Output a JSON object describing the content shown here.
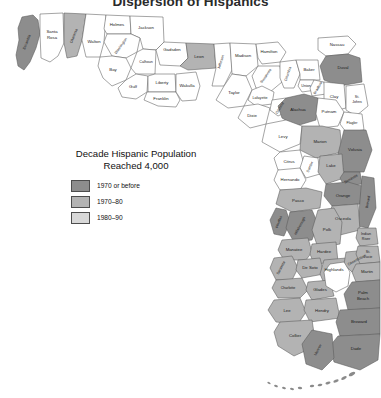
{
  "title": "Dispersion of Hispanics",
  "legend": {
    "title_line1": "Decade Hispanic Population",
    "title_line2": "Reached 4,000",
    "items": [
      {
        "label": "1970 or before",
        "color": "#8d8d8d",
        "level": 1
      },
      {
        "label": "1970–80",
        "color": "#b3b3b3",
        "level": 2
      },
      {
        "label": "1980–90",
        "color": "#d8d8d8",
        "level": 3
      }
    ]
  },
  "map": {
    "state": "Florida",
    "unshaded_color": "#ffffff",
    "border_color": "#5a5a5a",
    "water_feature": "Lake Okeechobee",
    "island_chain": "Florida Keys",
    "counties": [
      {
        "name": "Escambia",
        "level": 1,
        "rot": -68
      },
      {
        "name": "Santa Rosa",
        "level": 0,
        "rot": 0,
        "two_line": true
      },
      {
        "name": "Okaloosa",
        "level": 2,
        "rot": -68
      },
      {
        "name": "Walton",
        "level": 0,
        "rot": 0
      },
      {
        "name": "Holmes",
        "level": 0,
        "rot": 0
      },
      {
        "name": "Jackson",
        "level": 0,
        "rot": 0
      },
      {
        "name": "Washington",
        "level": 0,
        "rot": -55
      },
      {
        "name": "Bay",
        "level": 0,
        "rot": 0
      },
      {
        "name": "Calhoun",
        "level": 0,
        "rot": 0
      },
      {
        "name": "Gulf",
        "level": 0,
        "rot": 0
      },
      {
        "name": "Liberty",
        "level": 0,
        "rot": 0
      },
      {
        "name": "Franklin",
        "level": 0,
        "rot": 0
      },
      {
        "name": "Gadsden",
        "level": 0,
        "rot": 0
      },
      {
        "name": "Leon",
        "level": 2,
        "rot": 0
      },
      {
        "name": "Wakulla",
        "level": 0,
        "rot": 0
      },
      {
        "name": "Jefferson",
        "level": 0,
        "rot": -72
      },
      {
        "name": "Madison",
        "level": 0,
        "rot": 0
      },
      {
        "name": "Taylor",
        "level": 0,
        "rot": 0
      },
      {
        "name": "Hamilton",
        "level": 0,
        "rot": 0
      },
      {
        "name": "Suwannee",
        "level": 0,
        "rot": -55
      },
      {
        "name": "Columbia",
        "level": 0,
        "rot": -72
      },
      {
        "name": "Lafayette",
        "level": 0,
        "rot": 0
      },
      {
        "name": "Dixie",
        "level": 0,
        "rot": 0
      },
      {
        "name": "Gilchrist",
        "level": 0,
        "rot": -60
      },
      {
        "name": "Baker",
        "level": 0,
        "rot": 0
      },
      {
        "name": "Nassau",
        "level": 0,
        "rot": 0
      },
      {
        "name": "Duval",
        "level": 1,
        "rot": 0
      },
      {
        "name": "Union",
        "level": 0,
        "rot": 0
      },
      {
        "name": "Bradford",
        "level": 0,
        "rot": -60
      },
      {
        "name": "Clay",
        "level": 0,
        "rot": 0
      },
      {
        "name": "St. Johns",
        "level": 0,
        "rot": 0,
        "two_line": true
      },
      {
        "name": "Alachua",
        "level": 1,
        "rot": 0
      },
      {
        "name": "Putnam",
        "level": 0,
        "rot": 0
      },
      {
        "name": "Flagler",
        "level": 0,
        "rot": 0
      },
      {
        "name": "Levy",
        "level": 0,
        "rot": 0
      },
      {
        "name": "Marion",
        "level": 2,
        "rot": 0
      },
      {
        "name": "Volusia",
        "level": 1,
        "rot": 0
      },
      {
        "name": "Citrus",
        "level": 0,
        "rot": 0
      },
      {
        "name": "Sumter",
        "level": 0,
        "rot": -65
      },
      {
        "name": "Lake",
        "level": 2,
        "rot": 0
      },
      {
        "name": "Seminole",
        "level": 1,
        "rot": -30
      },
      {
        "name": "Hernando",
        "level": 0,
        "rot": 0
      },
      {
        "name": "Orange",
        "level": 1,
        "rot": 0
      },
      {
        "name": "Brevard",
        "level": 1,
        "rot": -80
      },
      {
        "name": "Pasco",
        "level": 2,
        "rot": 0
      },
      {
        "name": "Osceola",
        "level": 2,
        "rot": 0
      },
      {
        "name": "Pinellas",
        "level": 1,
        "rot": -70
      },
      {
        "name": "Hillsborough",
        "level": 1,
        "rot": -62
      },
      {
        "name": "Polk",
        "level": 2,
        "rot": 0
      },
      {
        "name": "Indian River",
        "level": 2,
        "rot": 0,
        "two_line": true
      },
      {
        "name": "Manatee",
        "level": 2,
        "rot": 0
      },
      {
        "name": "Hardee",
        "level": 2,
        "rot": 0
      },
      {
        "name": "Okeechobee",
        "level": 2,
        "rot": -28
      },
      {
        "name": "St. Lucie",
        "level": 2,
        "rot": 0,
        "two_line": true
      },
      {
        "name": "Sarasota",
        "level": 2,
        "rot": -62
      },
      {
        "name": "De Soto",
        "level": 2,
        "rot": 0
      },
      {
        "name": "Highlands",
        "level": 2,
        "rot": 0
      },
      {
        "name": "Martin",
        "level": 2,
        "rot": 0
      },
      {
        "name": "Charlotte",
        "level": 2,
        "rot": 0
      },
      {
        "name": "Glades",
        "level": 2,
        "rot": 0
      },
      {
        "name": "Palm Beach",
        "level": 2,
        "rot": 0,
        "two_line": true
      },
      {
        "name": "Lee",
        "level": 2,
        "rot": 0
      },
      {
        "name": "Hendry",
        "level": 2,
        "rot": 0
      },
      {
        "name": "Collier",
        "level": 2,
        "rot": 0
      },
      {
        "name": "Broward",
        "level": 1,
        "rot": 0
      },
      {
        "name": "Monroe",
        "level": 1,
        "rot": -62
      },
      {
        "name": "Dade",
        "level": 1,
        "rot": 0
      }
    ]
  }
}
